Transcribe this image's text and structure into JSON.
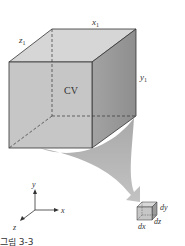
{
  "diagram": {
    "control_volume": {
      "label": "CV",
      "edge_labels": {
        "x": "x",
        "x_sub": "1",
        "y": "y",
        "y_sub": "1",
        "z": "z",
        "z_sub": "1"
      }
    },
    "differential_element": {
      "labels": {
        "dx": "dx",
        "dy": "dy",
        "dz": "dz"
      }
    },
    "axes": {
      "x": "x",
      "y": "y",
      "z": "z"
    },
    "caption": "그림 3-3",
    "colors": {
      "front_face": "#c9c9c9",
      "top_face": "#d9d9d9",
      "side_face": "#9a9a9a",
      "edge": "#333333",
      "arrow": "#a8a8a8",
      "text": "#333333"
    }
  }
}
